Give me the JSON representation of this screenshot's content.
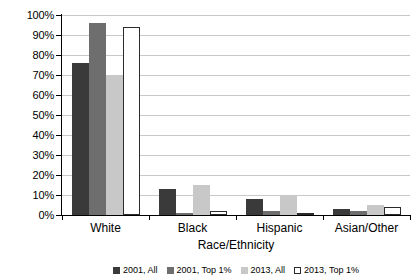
{
  "chart_data": {
    "type": "bar",
    "title": "",
    "xlabel": "Race/Ethnicity",
    "ylabel": "",
    "ylim": [
      0,
      100
    ],
    "ytick_labels": [
      "100%",
      "90%",
      "80%",
      "70%",
      "60%",
      "50%",
      "40%",
      "30%",
      "20%",
      "10%",
      "0%"
    ],
    "ytick_values": [
      100,
      90,
      80,
      70,
      60,
      50,
      40,
      30,
      20,
      10,
      0
    ],
    "grid": "horizontal",
    "legend_position": "bottom",
    "categories": [
      "White",
      "Black",
      "Hispanic",
      "Asian/Other"
    ],
    "series": [
      {
        "name": "2001, All",
        "values": [
          76,
          13,
          8,
          3
        ]
      },
      {
        "name": "2001, Top 1%",
        "values": [
          96,
          1,
          2,
          2
        ]
      },
      {
        "name": "2013, All",
        "values": [
          70,
          15,
          10,
          5
        ]
      },
      {
        "name": "2013, Top 1%",
        "values": [
          94,
          2,
          1,
          4
        ]
      }
    ]
  },
  "colors": {
    "series_0": "#3a3a3a",
    "series_1": "#6e6e6e",
    "series_2": "#c8c8c8",
    "series_3": "#ffffff",
    "axis": "#000000",
    "gridline": "#c9c9c9",
    "background": "#ffffff"
  }
}
